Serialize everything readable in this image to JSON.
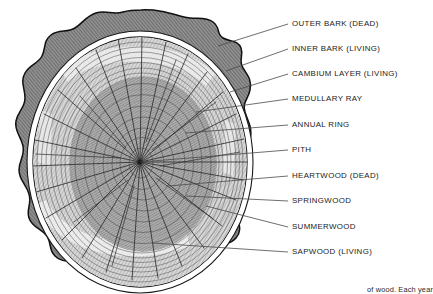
{
  "figure": {
    "title_visible": false,
    "caption": "of wood. Each year",
    "background_color": "#ffffff"
  },
  "colors": {
    "outer_bark": "#8a8a8a",
    "outer_bark_outline": "#111111",
    "inner_bark": "#ffffff",
    "cambium": "#e8e8e8",
    "sapwood": "#c9c9c9",
    "heartwood": "#9a9a9a",
    "ring_line": "#555555",
    "ray_line": "#333333",
    "leader_line": "#4a4a4a",
    "label_text": "#1a1a1a"
  },
  "geometry": {
    "center_x": 140,
    "center_y": 162,
    "pith_x": 140,
    "pith_y": 162,
    "outer_radius_x": 116,
    "outer_radius_y": 134,
    "annual_ring_count": 22,
    "medullary_ray_count": 34
  },
  "labels": [
    {
      "id": "outer-bark",
      "text": "OUTER BARK (DEAD)",
      "x": 292,
      "y": 24,
      "leader_from_x": 218,
      "leader_from_y": 46
    },
    {
      "id": "inner-bark",
      "text": "INNER BARK (LIVING)",
      "x": 292,
      "y": 49,
      "leader_from_x": 226,
      "leader_from_y": 71
    },
    {
      "id": "cambium-layer",
      "text": "CAMBIUM LAYER (LIVING)",
      "x": 292,
      "y": 74,
      "leader_from_x": 230,
      "leader_from_y": 92
    },
    {
      "id": "medullary-ray",
      "text": "MEDULLARY RAY",
      "x": 292,
      "y": 99,
      "leader_from_x": 196,
      "leader_from_y": 112
    },
    {
      "id": "annual-ring",
      "text": "ANNUAL RING",
      "x": 292,
      "y": 125,
      "leader_from_x": 185,
      "leader_from_y": 133
    },
    {
      "id": "pith",
      "text": "PITH",
      "x": 292,
      "y": 150,
      "leader_from_x": 140,
      "leader_from_y": 162
    },
    {
      "id": "heartwood",
      "text": "HEARTWOOD (DEAD)",
      "x": 292,
      "y": 176,
      "leader_from_x": 168,
      "leader_from_y": 186
    },
    {
      "id": "springwood",
      "text": "SPRINGWOOD",
      "x": 292,
      "y": 201,
      "leader_from_x": 186,
      "leader_from_y": 196
    },
    {
      "id": "summerwood",
      "text": "SUMMERWOOD",
      "x": 292,
      "y": 227,
      "leader_from_x": 206,
      "leader_from_y": 206
    },
    {
      "id": "sapwood",
      "text": "SAPWOOD (LIVING)",
      "x": 292,
      "y": 252,
      "leader_from_x": 152,
      "leader_from_y": 243
    }
  ]
}
